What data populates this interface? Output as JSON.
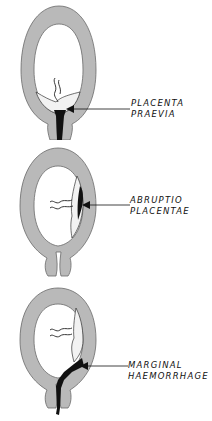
{
  "figure": {
    "colors": {
      "uterine_wall": "#b9b9b9",
      "wall_outline": "#6a6a6a",
      "placenta": "#f2f2f2",
      "haemorrhage": "#111111",
      "background": "#ffffff"
    },
    "panels": [
      {
        "label_line1": "PLACENTA",
        "label_line2": "PRAEVIA"
      },
      {
        "label_line1": "ABRUPTIO",
        "label_line2": "PLACENTAE"
      },
      {
        "label_line1": "MARGINAL",
        "label_line2": "HAEMORRHAGE"
      }
    ]
  }
}
